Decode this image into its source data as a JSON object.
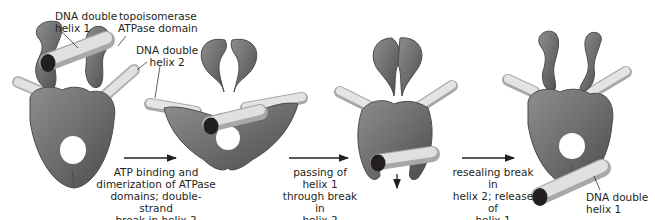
{
  "colors": {
    "protein": "#6d6e70",
    "protein_light": "#8c8d8f",
    "protein_dark": "#4a4b4d",
    "dna": "#d6d6d6",
    "dna_shade": "#b3b3b3",
    "dna_end": "#231f20",
    "text": "#231f20",
    "arrow": "#231f20"
  },
  "labels": {
    "dna_helix_1_top": "DNA double\nhelix 1",
    "atpase_domain": "topoisomerase\nATPase domain",
    "dna_helix_2": "DNA double\nhelix 2",
    "dna_helix_1_bottom": "DNA double\nhelix 1"
  },
  "steps": [
    {
      "caption": "ATP binding and\ndimerization of ATPase\ndomains; double-strand\nbreak in helix 2"
    },
    {
      "caption": "passing of helix 1\nthrough break in\nhelix 2"
    },
    {
      "caption": "resealing break in\nhelix 2; release of\nhelix 1"
    }
  ],
  "stages": [
    {
      "name": "initial complex"
    },
    {
      "name": "ATPase dimerized, helix 2 cut"
    },
    {
      "name": "helix 1 passed through gate"
    },
    {
      "name": "helix 2 resealed, helix 1 released"
    }
  ]
}
